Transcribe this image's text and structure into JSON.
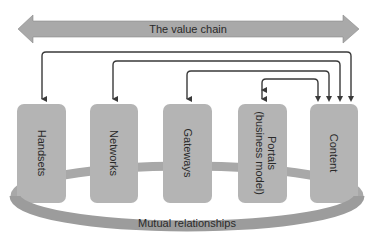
{
  "diagram": {
    "banner": {
      "label": "The value chain",
      "color": "#a9a9a9"
    },
    "boxes": [
      {
        "id": "handsets",
        "label": "Handsets"
      },
      {
        "id": "networks",
        "label": "Networks"
      },
      {
        "id": "gateways",
        "label": "Gateways"
      },
      {
        "id": "portals",
        "label_line1": "Portals",
        "label_line2": "(business model)"
      },
      {
        "id": "content",
        "label": "Content"
      }
    ],
    "ring": {
      "label": "Mutual relationships",
      "color": "#9a9a9a"
    },
    "connections": [
      {
        "from": "content",
        "to": "handsets"
      },
      {
        "from": "content",
        "to": "networks"
      },
      {
        "from": "content",
        "to": "gateways"
      },
      {
        "from": "content",
        "to": "portals",
        "bidirectional": true
      }
    ],
    "colors": {
      "box": "#b4b4b4",
      "arrow": "#3a3a3a",
      "text": "#2a2a2a"
    }
  }
}
